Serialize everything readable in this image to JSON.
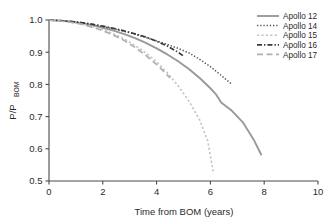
{
  "chart_data": {
    "type": "line",
    "title": "",
    "xlabel": "Time from BOM (years)",
    "ylabel": "P/P",
    "ylabel_sub": "BOM",
    "xlim": [
      0,
      10
    ],
    "ylim": [
      0.5,
      1.0
    ],
    "xticks": [
      0,
      2,
      4,
      6,
      8,
      10
    ],
    "xtick_labels": [
      "0",
      "2",
      "4",
      "6",
      "8",
      "10"
    ],
    "yticks": [
      0.5,
      0.6,
      0.7,
      0.8,
      0.9,
      1.0
    ],
    "ytick_labels": [
      "0.5",
      "0.6",
      "0.7",
      "0.8",
      "0.9",
      "1.0"
    ],
    "grid": false,
    "legend_position": "top-right",
    "series": [
      {
        "name": "Apollo 12",
        "style": "solid",
        "color": "#999999",
        "width": 1.9,
        "dash": "none",
        "x": [
          0.0,
          0.4,
          0.8,
          1.2,
          1.6,
          2.0,
          2.4,
          2.8,
          3.2,
          3.6,
          4.0,
          4.4,
          4.8,
          5.2,
          5.6,
          6.0,
          6.2,
          6.4,
          6.8,
          7.2,
          7.6,
          7.9
        ],
        "y": [
          1.0,
          0.998,
          0.995,
          0.99,
          0.984,
          0.976,
          0.967,
          0.956,
          0.944,
          0.929,
          0.912,
          0.893,
          0.872,
          0.848,
          0.82,
          0.788,
          0.77,
          0.744,
          0.718,
          0.683,
          0.63,
          0.58
        ]
      },
      {
        "name": "Apollo 14",
        "style": "dotted",
        "color": "#4f4f4f",
        "width": 1.5,
        "dash": "1.3,1.9",
        "x": [
          0.0,
          0.4,
          0.8,
          1.2,
          1.6,
          2.0,
          2.4,
          2.8,
          3.2,
          3.6,
          4.0,
          4.4,
          4.8,
          5.2,
          5.6,
          6.0,
          6.4,
          6.8
        ],
        "y": [
          1.0,
          0.998,
          0.995,
          0.991,
          0.986,
          0.98,
          0.973,
          0.965,
          0.956,
          0.946,
          0.935,
          0.924,
          0.912,
          0.898,
          0.878,
          0.855,
          0.828,
          0.8
        ]
      },
      {
        "name": "Apollo 15",
        "style": "dashed-fine",
        "color": "#c4c4c4",
        "width": 1.6,
        "dash": "2.2,2.2",
        "x": [
          0.0,
          0.4,
          0.8,
          1.2,
          1.6,
          2.0,
          2.4,
          2.8,
          3.2,
          3.6,
          4.0,
          4.4,
          4.8,
          5.2,
          5.6,
          5.9,
          6.1
        ],
        "y": [
          1.0,
          0.998,
          0.994,
          0.988,
          0.98,
          0.97,
          0.957,
          0.941,
          0.921,
          0.898,
          0.87,
          0.836,
          0.796,
          0.748,
          0.69,
          0.625,
          0.53
        ]
      },
      {
        "name": "Apollo 16",
        "style": "dash-dot",
        "color": "#3a3a3a",
        "width": 1.7,
        "dash": "5,2,1.4,2",
        "x": [
          0.0,
          0.4,
          0.8,
          1.2,
          1.6,
          2.0,
          2.4,
          2.8,
          3.2,
          3.6,
          4.0,
          4.4,
          4.8,
          5.0
        ],
        "y": [
          1.0,
          0.998,
          0.996,
          0.992,
          0.987,
          0.981,
          0.974,
          0.966,
          0.957,
          0.947,
          0.934,
          0.919,
          0.9,
          0.888
        ]
      },
      {
        "name": "Apollo 17",
        "style": "long-dash",
        "color": "#b0b0b0",
        "width": 1.7,
        "dash": "6,3.5",
        "x": [
          0.0,
          0.4,
          0.8,
          1.2,
          1.6,
          2.0,
          2.4,
          2.8,
          3.2,
          3.6,
          4.0,
          4.2,
          4.5
        ],
        "y": [
          1.0,
          0.997,
          0.993,
          0.987,
          0.978,
          0.967,
          0.953,
          0.936,
          0.915,
          0.89,
          0.862,
          0.846,
          0.82
        ]
      }
    ]
  },
  "legend": {
    "items": [
      {
        "label": "Apollo 12"
      },
      {
        "label": "Apollo 14"
      },
      {
        "label": "Apollo 15"
      },
      {
        "label": "Apollo 16"
      },
      {
        "label": "Apollo 17"
      }
    ]
  }
}
